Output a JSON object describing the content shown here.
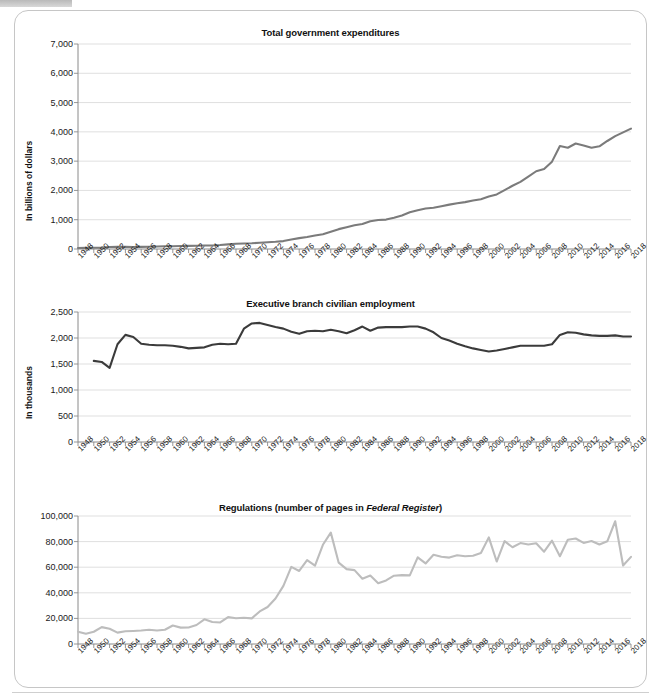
{
  "page": {
    "accent_line_1": "#7b7b7b",
    "accent_line_2": "#3b3b3b",
    "accent_line_3": "#bdbdbd",
    "grid_color": "#d7d7d7",
    "axis_color": "#8a8a8a"
  },
  "chart_data": [
    {
      "type": "line",
      "title": "Total government expenditures",
      "title_plain": "Total government expenditures",
      "xlabel": "",
      "ylabel": "In billions of dollars",
      "ylim": [
        0,
        7000
      ],
      "yticks": [
        0,
        1000,
        2000,
        3000,
        4000,
        5000,
        6000,
        7000
      ],
      "ytick_labels": [
        "0",
        "1,000",
        "2,000",
        "3,000",
        "4,000",
        "5,000",
        "6,000",
        "7,000"
      ],
      "xlim": [
        1948,
        2018
      ],
      "xticks": [
        1948,
        1950,
        1952,
        1954,
        1956,
        1958,
        1960,
        1962,
        1964,
        1966,
        1968,
        1970,
        1972,
        1974,
        1976,
        1978,
        1980,
        1982,
        1984,
        1986,
        1988,
        1990,
        1992,
        1994,
        1996,
        1998,
        2000,
        2002,
        2004,
        2006,
        2008,
        2010,
        2012,
        2014,
        2016,
        2018
      ],
      "xtick_labels": [
        "1948",
        "1950",
        "1952",
        "1954",
        "1956",
        "1958",
        "1960",
        "1962",
        "1964",
        "1966",
        "1968",
        "1970",
        "1972",
        "1974",
        "1976",
        "1978",
        "1980",
        "1982",
        "1984",
        "1986",
        "1988",
        "1990",
        "1992",
        "1994",
        "1996",
        "1998",
        "2000",
        "2002",
        "2004",
        "2006",
        "2008",
        "2010",
        "2012",
        "2014",
        "2016",
        "2018"
      ],
      "grid": true,
      "legend": "none",
      "series": [
        {
          "name": "Total government expenditures",
          "color": "#7b7b7b",
          "x": [
            1948,
            1949,
            1950,
            1951,
            1952,
            1953,
            1954,
            1955,
            1956,
            1957,
            1958,
            1959,
            1960,
            1961,
            1962,
            1963,
            1964,
            1965,
            1966,
            1967,
            1968,
            1969,
            1970,
            1971,
            1972,
            1973,
            1974,
            1975,
            1976,
            1977,
            1978,
            1979,
            1980,
            1981,
            1982,
            1983,
            1984,
            1985,
            1986,
            1987,
            1988,
            1989,
            1990,
            1991,
            1992,
            1993,
            1994,
            1995,
            1996,
            1997,
            1998,
            1999,
            2000,
            2001,
            2002,
            2003,
            2004,
            2005,
            2006,
            2007,
            2008,
            2009,
            2010,
            2011,
            2012,
            2013,
            2014,
            2015,
            2016,
            2017,
            2018
          ],
          "values": [
            33,
            40,
            43,
            46,
            68,
            76,
            71,
            69,
            72,
            77,
            83,
            92,
            93,
            101,
            107,
            112,
            119,
            120,
            135,
            159,
            180,
            189,
            196,
            211,
            232,
            248,
            270,
            326,
            372,
            409,
            459,
            504,
            591,
            678,
            746,
            809,
            852,
            946,
            990,
            1004,
            1065,
            1144,
            1253,
            1324,
            1382,
            1409,
            1462,
            1516,
            1561,
            1601,
            1653,
            1702,
            1789,
            1863,
            2011,
            2160,
            2293,
            2472,
            2655,
            2729,
            2983,
            3518,
            3457,
            3603,
            3537,
            3455,
            3506,
            3688,
            3853,
            3982,
            4109
          ]
        }
      ],
      "notes": "Smooth monotonic growth; plateau near 2009-2013 then rise to ~6,000 billion by 2018"
    },
    {
      "type": "line",
      "title": "Executive branch civilian employment",
      "title_plain": "Executive branch civilian employment",
      "xlabel": "",
      "ylabel": "In thousands",
      "ylim": [
        0,
        2500
      ],
      "yticks": [
        0,
        500,
        1000,
        1500,
        2000,
        2500
      ],
      "ytick_labels": [
        "0",
        "500",
        "1,000",
        "1,500",
        "2,000",
        "2,500"
      ],
      "xlim": [
        1948,
        2018
      ],
      "xticks": [
        1948,
        1950,
        1952,
        1954,
        1956,
        1958,
        1960,
        1962,
        1964,
        1966,
        1968,
        1970,
        1972,
        1974,
        1976,
        1978,
        1980,
        1982,
        1984,
        1986,
        1988,
        1990,
        1992,
        1994,
        1996,
        1998,
        2000,
        2002,
        2004,
        2006,
        2008,
        2010,
        2012,
        2014,
        2016,
        2018
      ],
      "xtick_labels": [
        "1948",
        "1950",
        "1952",
        "1954",
        "1956",
        "1958",
        "1960",
        "1962",
        "1964",
        "1966",
        "1968",
        "1970",
        "1972",
        "1974",
        "1976",
        "1978",
        "1980",
        "1982",
        "1984",
        "1986",
        "1988",
        "1990",
        "1992",
        "1994",
        "1996",
        "1998",
        "2000",
        "2002",
        "2004",
        "2006",
        "2008",
        "2010",
        "2012",
        "2014",
        "2016",
        "2018"
      ],
      "grid": true,
      "legend": "none",
      "series": [
        {
          "name": "Executive branch civilian employment",
          "color": "#3b3b3b",
          "x": [
            1950,
            1951,
            1952,
            1953,
            1954,
            1955,
            1956,
            1957,
            1958,
            1959,
            1960,
            1961,
            1962,
            1963,
            1964,
            1965,
            1966,
            1967,
            1968,
            1969,
            1970,
            1971,
            1972,
            1973,
            1974,
            1975,
            1976,
            1977,
            1978,
            1979,
            1980,
            1981,
            1982,
            1983,
            1984,
            1985,
            1986,
            1987,
            1988,
            1989,
            1990,
            1991,
            1992,
            1993,
            1994,
            1995,
            1996,
            1997,
            1998,
            1999,
            2000,
            2001,
            2002,
            2003,
            2004,
            2005,
            2006,
            2007,
            2008,
            2009,
            2010,
            2011,
            2012,
            2013,
            2014,
            2015,
            2016,
            2017,
            2018
          ],
          "values": [
            1560,
            1540,
            1425,
            1880,
            2060,
            2020,
            1890,
            1870,
            1860,
            1860,
            1850,
            1830,
            1800,
            1810,
            1820,
            1870,
            1890,
            1880,
            1890,
            2180,
            2280,
            2290,
            2250,
            2210,
            2180,
            2120,
            2080,
            2130,
            2140,
            2130,
            2160,
            2130,
            2090,
            2150,
            2220,
            2140,
            2200,
            2210,
            2210,
            2210,
            2220,
            2220,
            2180,
            2110,
            2000,
            1950,
            1890,
            1840,
            1800,
            1770,
            1740,
            1760,
            1790,
            1820,
            1850,
            1850,
            1850,
            1850,
            1880,
            2060,
            2110,
            2100,
            2070,
            2050,
            2040,
            2040,
            2050,
            2030,
            2030
          ]
        }
      ],
      "notes": "Starts ~1,560 in 1950, dips to ~1,425 in 1952, jumps to ~2,060 by 1954, flat near 1,850 through 1960s, rises to ~2,290 around 1970, plateau ~2,100-2,220, declines to ~1,740 around 2000, recovers to ~2,100 in 2010 and ~2,030 by 2018"
    },
    {
      "type": "line",
      "title": "Regulations (number of pages in Federal Register)",
      "title_plain": "Regulations (number of pages in Federal Register)",
      "title_italic_part": "Federal Register",
      "xlabel": "",
      "ylabel": "",
      "ylim": [
        0,
        100000
      ],
      "yticks": [
        0,
        20000,
        40000,
        60000,
        80000,
        100000
      ],
      "ytick_labels": [
        "0",
        "20,000",
        "40,000",
        "60,000",
        "80,000",
        "100,000"
      ],
      "xlim": [
        1948,
        2018
      ],
      "xticks": [
        1948,
        1950,
        1952,
        1954,
        1956,
        1958,
        1960,
        1962,
        1964,
        1966,
        1968,
        1970,
        1972,
        1974,
        1976,
        1978,
        1980,
        1982,
        1984,
        1986,
        1988,
        1990,
        1992,
        1994,
        1996,
        1998,
        2000,
        2002,
        2004,
        2006,
        2008,
        2010,
        2012,
        2014,
        2016,
        2018
      ],
      "xtick_labels": [
        "1948",
        "1950",
        "1952",
        "1954",
        "1956",
        "1958",
        "1960",
        "1962",
        "1964",
        "1966",
        "1968",
        "1970",
        "1972",
        "1974",
        "1976",
        "1978",
        "1980",
        "1982",
        "1984",
        "1986",
        "1988",
        "1990",
        "1992",
        "1994",
        "1996",
        "1998",
        "2000",
        "2002",
        "2004",
        "2006",
        "2008",
        "2010",
        "2012",
        "2014",
        "2016",
        "2018"
      ],
      "grid": true,
      "legend": "none",
      "series": [
        {
          "name": "Pages in Federal Register",
          "color": "#bdbdbd",
          "x": [
            1948,
            1949,
            1950,
            1951,
            1952,
            1953,
            1954,
            1955,
            1956,
            1957,
            1958,
            1959,
            1960,
            1961,
            1962,
            1963,
            1964,
            1965,
            1966,
            1967,
            1968,
            1969,
            1970,
            1971,
            1972,
            1973,
            1974,
            1975,
            1976,
            1977,
            1978,
            1979,
            1980,
            1981,
            1982,
            1983,
            1984,
            1985,
            1986,
            1987,
            1988,
            1989,
            1990,
            1991,
            1992,
            1993,
            1994,
            1995,
            1996,
            1997,
            1998,
            1999,
            2000,
            2001,
            2002,
            2003,
            2004,
            2005,
            2006,
            2007,
            2008,
            2009,
            2010,
            2011,
            2012,
            2013,
            2014,
            2015,
            2016,
            2017,
            2018
          ],
          "values": [
            9608,
            7952,
            9562,
            13175,
            11896,
            8912,
            9910,
            10196,
            10528,
            11156,
            10579,
            11116,
            14479,
            12792,
            12919,
            14842,
            19304,
            17206,
            16850,
            21088,
            20068,
            20464,
            20036,
            25447,
            28924,
            35586,
            45422,
            60221,
            57072,
            65603,
            61261,
            77498,
            87012,
            63554,
            58494,
            57704,
            50998,
            53480,
            47418,
            49654,
            53376,
            53842,
            53618,
            67716,
            62928,
            69688,
            68108,
            67518,
            69368,
            68530,
            68982,
            71161,
            83294,
            64438,
            80332,
            75606,
            78851,
            77752,
            78724,
            72090,
            80700,
            68598,
            81405,
            82419,
            78961,
            80462,
            77687,
            80260,
            95894,
            61308,
            68082
          ]
        }
      ],
      "notes": "Low ~10,000-20,000 until ~1970, steep rise to peak ~87,000 in 1980, drop to ~47,000 mid-1980s, climbs to 70,000-80,000, spike ~96,000 in 2016, falls to ~61,000 in 2017 then ~68,000 in 2018"
    }
  ]
}
